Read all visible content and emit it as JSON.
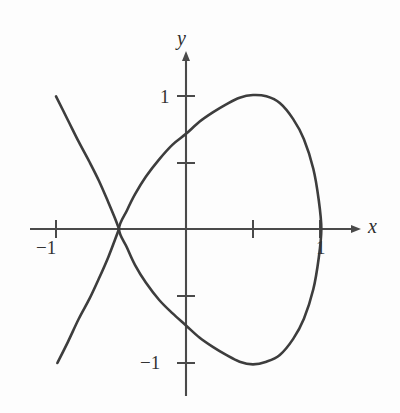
{
  "figure": {
    "title": "",
    "background_color": "#fdfdfd",
    "curve_color": "#3d3d3d",
    "axis_color": "#4a4a4a",
    "text_color": "#333333"
  },
  "axes": {
    "x_axis_label": "x",
    "y_axis_label": "y",
    "x_tick_labels": [
      "−1",
      "1"
    ],
    "y_tick_labels": [
      "1",
      "−1"
    ],
    "x_label_neg1": "−1",
    "x_label_1": "1",
    "y_label_1": "1",
    "y_label_neg1": "−1"
  },
  "chart_data": {
    "type": "line",
    "title": "",
    "xlabel": "x",
    "ylabel": "y",
    "xlim": [
      -1.25,
      1.4
    ],
    "ylim": [
      -1.3,
      1.3
    ],
    "grid": false,
    "legend": null,
    "x_ticks": [
      -1,
      -0.5,
      0.5,
      1
    ],
    "x_tick_labels": [
      "−1",
      "",
      "",
      "1"
    ],
    "y_ticks": [
      1,
      0.5,
      -0.5,
      -1
    ],
    "y_tick_labels": [
      "1",
      "",
      "",
      "−1"
    ],
    "axis_arrows": [
      "x-positive",
      "y-positive"
    ],
    "annotations": [
      {
        "text": "node / self-intersection",
        "x": -0.5,
        "y": 0
      }
    ],
    "series": [
      {
        "name": "loop (closed branch)",
        "description": "Closed loop from node (-0.5, 0) through maximum (0.5, 1), rightmost point (1, 0), minimum (0.5, -1) and back to node",
        "points": [
          [
            -0.5,
            0.0
          ],
          [
            -0.44,
            0.14
          ],
          [
            -0.38,
            0.26
          ],
          [
            -0.3,
            0.39
          ],
          [
            -0.2,
            0.52
          ],
          [
            -0.1,
            0.63
          ],
          [
            0.0,
            0.71
          ],
          [
            0.1,
            0.8
          ],
          [
            0.2,
            0.87
          ],
          [
            0.3,
            0.93
          ],
          [
            0.4,
            0.98
          ],
          [
            0.5,
            1.0
          ],
          [
            0.6,
            0.99
          ],
          [
            0.7,
            0.94
          ],
          [
            0.8,
            0.82
          ],
          [
            0.88,
            0.67
          ],
          [
            0.95,
            0.45
          ],
          [
            0.99,
            0.22
          ],
          [
            1.01,
            0.0
          ],
          [
            0.99,
            -0.22
          ],
          [
            0.95,
            -0.45
          ],
          [
            0.88,
            -0.67
          ],
          [
            0.8,
            -0.82
          ],
          [
            0.7,
            -0.94
          ],
          [
            0.6,
            -0.99
          ],
          [
            0.5,
            -1.01
          ],
          [
            0.4,
            -0.99
          ],
          [
            0.3,
            -0.94
          ],
          [
            0.2,
            -0.88
          ],
          [
            0.1,
            -0.81
          ],
          [
            0.0,
            -0.72
          ],
          [
            -0.1,
            -0.63
          ],
          [
            -0.2,
            -0.53
          ],
          [
            -0.3,
            -0.4
          ],
          [
            -0.38,
            -0.27
          ],
          [
            -0.44,
            -0.14
          ],
          [
            -0.5,
            0.0
          ]
        ]
      },
      {
        "name": "upper-left open branch",
        "description": "Open branch descending from upper left to the node",
        "points": [
          [
            -0.97,
            0.99
          ],
          [
            -0.88,
            0.81
          ],
          [
            -0.8,
            0.65
          ],
          [
            -0.72,
            0.5
          ],
          [
            -0.65,
            0.36
          ],
          [
            -0.58,
            0.2
          ],
          [
            -0.53,
            0.08
          ],
          [
            -0.5,
            0.0
          ]
        ]
      },
      {
        "name": "lower-left open branch",
        "description": "Open branch descending from the node to the lower left",
        "points": [
          [
            -0.5,
            0.0
          ],
          [
            -0.53,
            -0.08
          ],
          [
            -0.58,
            -0.21
          ],
          [
            -0.65,
            -0.37
          ],
          [
            -0.72,
            -0.52
          ],
          [
            -0.8,
            -0.67
          ],
          [
            -0.88,
            -0.84
          ],
          [
            -0.96,
            -1.0
          ]
        ]
      }
    ]
  }
}
